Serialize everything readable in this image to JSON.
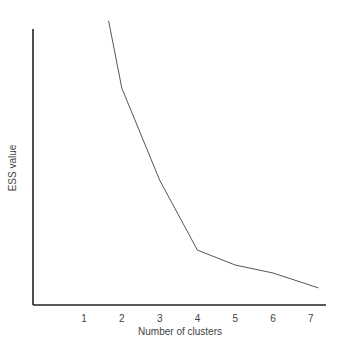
{
  "chart_data": {
    "type": "line",
    "title": "",
    "xlabel": "Number of clusters",
    "ylabel": "ESS value",
    "x_ticks": [
      "1",
      "2",
      "3",
      "4",
      "5",
      "6",
      "7"
    ],
    "y_ticks": [],
    "grid": false,
    "legend": null,
    "xlim": [
      0,
      7.4
    ],
    "ylim": [
      0,
      100
    ],
    "y_units": "relative (no y tick labels shown; 0 = x-axis, 100 = top of y-axis)",
    "series": [
      {
        "name": "ESS",
        "x": [
          1.65,
          2,
          3,
          4,
          5,
          6,
          7.2
        ],
        "y": [
          103,
          78.6,
          45.3,
          19.9,
          14.5,
          11.6,
          6.2
        ]
      }
    ],
    "colors": {
      "axis": "#222222",
      "line": "#555555",
      "text": "#444444"
    }
  }
}
